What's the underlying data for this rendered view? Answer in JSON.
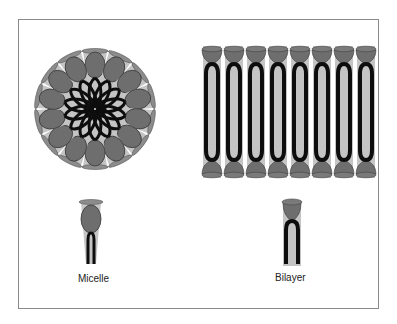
{
  "diagram": {
    "labels": {
      "micelle": "Micelle",
      "bilayer": "Bilayer"
    },
    "colors": {
      "head": "#6e6e6e",
      "head_stroke": "#3a3a3a",
      "tail": "#0d0d0d",
      "cone": "#c4c4c4",
      "cap": "#8c8c8c",
      "frame": "#8a8a8a"
    },
    "micelle": {
      "center_x": 95,
      "center_y": 109,
      "lipid_count": 14
    },
    "bilayer": {
      "columns": 8,
      "leaflets": 2
    }
  }
}
